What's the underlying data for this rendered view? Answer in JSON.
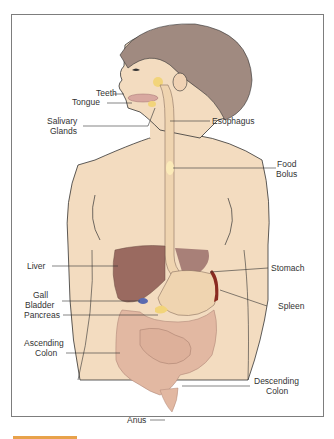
{
  "figure": {
    "labels": {
      "teeth": "Teeth",
      "tongue": "Tongue",
      "salivary_glands_1": "Salivary",
      "salivary_glands_2": "Glands",
      "esophagus": "Esophagus",
      "food_bolus_1": "Food",
      "food_bolus_2": "Bolus",
      "liver": "Liver",
      "stomach": "Stomach",
      "gall_bladder_1": "Gall",
      "gall_bladder_2": "Bladder",
      "spleen": "Spleen",
      "pancreas": "Pancreas",
      "ascending_colon_1": "Ascending",
      "ascending_colon_2": "Colon",
      "descending_colon_1": "Descending",
      "descending_colon_2": "Colon",
      "anus": "Anus"
    },
    "colors": {
      "skin": "#f3dcc0",
      "hair": "#a08a80",
      "liver": "#9a6a60",
      "stomach": "#efd4b0",
      "intestine": "#e2b8a2",
      "gland": "#f2d47a",
      "spleen": "#8a2a20",
      "gallbladder": "#5a6ab0",
      "accent": "#e8a24a",
      "frame": "#7d7d7d"
    }
  }
}
